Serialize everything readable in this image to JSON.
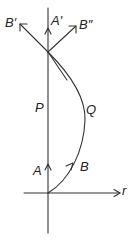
{
  "diagram": {
    "labels": {
      "b_prime": "B′",
      "a_prime": "A′",
      "b_double_prime": "B″",
      "p": "P",
      "q": "Q",
      "a": "A",
      "b": "B",
      "r": "r"
    },
    "colors": {
      "stroke": "#333333",
      "background": "#ffffff"
    },
    "elements": [
      {
        "id": "vertical-axis",
        "type": "line"
      },
      {
        "id": "r-axis",
        "type": "arrow-line",
        "label": "r"
      },
      {
        "id": "worldline-P",
        "type": "line",
        "label": "P"
      },
      {
        "id": "worldline-Q",
        "type": "curve",
        "label": "Q"
      },
      {
        "id": "vector-A",
        "type": "arrow",
        "label": "A"
      },
      {
        "id": "vector-B",
        "type": "arrow",
        "label": "B"
      },
      {
        "id": "vector-A-prime",
        "type": "arrow",
        "label": "A′"
      },
      {
        "id": "vector-B-prime",
        "type": "arrow",
        "label": "B′"
      },
      {
        "id": "vector-B-double-prime",
        "type": "arrow",
        "label": "B″"
      }
    ]
  }
}
